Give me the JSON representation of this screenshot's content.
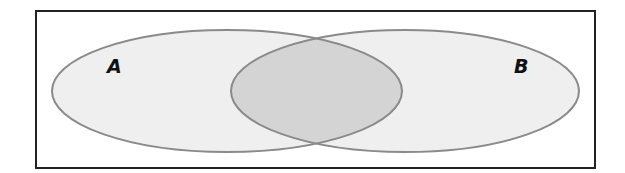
{
  "diagram": {
    "type": "venn",
    "sets": [
      {
        "id": "A",
        "label": "A",
        "fill": "#efefef",
        "stroke": "#8a8a8a"
      },
      {
        "id": "B",
        "label": "B",
        "fill": "#efefef",
        "stroke": "#8a8a8a"
      }
    ],
    "intersection": {
      "sets": [
        "A",
        "B"
      ],
      "fill": "#d4d4d4",
      "shaded": true
    },
    "frame": {
      "stroke": "#222222",
      "fill": "#ffffff"
    }
  }
}
